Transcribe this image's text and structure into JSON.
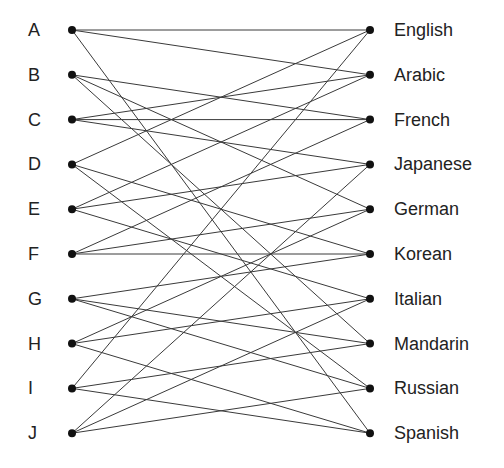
{
  "diagram": {
    "type": "bipartite-graph",
    "colors": {
      "edge": "#3a3a3a",
      "node": "#111111",
      "text": "#222222",
      "background": "#ffffff"
    },
    "left_nodes": [
      "A",
      "B",
      "C",
      "D",
      "E",
      "F",
      "G",
      "H",
      "I",
      "J"
    ],
    "right_nodes": [
      "English",
      "Arabic",
      "French",
      "Japanese",
      "German",
      "Korean",
      "Italian",
      "Mandarin",
      "Russian",
      "Spanish"
    ],
    "edges": [
      [
        "A",
        "English"
      ],
      [
        "A",
        "Arabic"
      ],
      [
        "A",
        "Spanish"
      ],
      [
        "B",
        "French"
      ],
      [
        "B",
        "German"
      ],
      [
        "B",
        "Mandarin"
      ],
      [
        "C",
        "Arabic"
      ],
      [
        "C",
        "French"
      ],
      [
        "C",
        "Japanese"
      ],
      [
        "D",
        "English"
      ],
      [
        "D",
        "Korean"
      ],
      [
        "D",
        "Russian"
      ],
      [
        "E",
        "Arabic"
      ],
      [
        "E",
        "Japanese"
      ],
      [
        "E",
        "Italian"
      ],
      [
        "F",
        "French"
      ],
      [
        "F",
        "German"
      ],
      [
        "F",
        "Korean"
      ],
      [
        "G",
        "Korean"
      ],
      [
        "G",
        "Mandarin"
      ],
      [
        "G",
        "Russian"
      ],
      [
        "H",
        "German"
      ],
      [
        "H",
        "Italian"
      ],
      [
        "H",
        "Spanish"
      ],
      [
        "I",
        "English"
      ],
      [
        "I",
        "Mandarin"
      ],
      [
        "I",
        "Spanish"
      ],
      [
        "J",
        "Japanese"
      ],
      [
        "J",
        "Italian"
      ],
      [
        "J",
        "Russian"
      ]
    ]
  }
}
